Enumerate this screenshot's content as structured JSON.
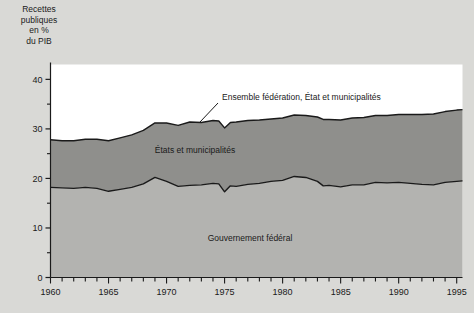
{
  "chart_data": {
    "type": "area",
    "title": "",
    "ylabel": "Recettes publiques en % du PIB",
    "xlabel": "",
    "stacked": true,
    "grid": false,
    "legend_position": "inline-annotations",
    "xlim": [
      1960,
      1995.5
    ],
    "ylim": [
      0,
      43
    ],
    "xticks_major": [
      1960,
      1965,
      1970,
      1975,
      1980,
      1985,
      1990,
      1995
    ],
    "xtick_labels": [
      "1960",
      "1965",
      "1970",
      "1975",
      "1980",
      "1985",
      "1990",
      "1995"
    ],
    "xticks_minor_step": 1,
    "yticks_major": [
      0,
      10,
      20,
      30,
      40
    ],
    "ytick_labels": [
      "0",
      "10",
      "20",
      "30",
      "40"
    ],
    "yticks_minor": [
      5,
      15,
      25,
      35
    ],
    "colors": {
      "background": "#d9d9d6",
      "plot_background": "#ffffff",
      "federal_band": "#b3b3b0",
      "state_band": "#8f8f8c",
      "line": "#1a1a1a",
      "frame": "#1a1a1a"
    },
    "x": [
      1960,
      1961,
      1962,
      1963,
      1964,
      1965,
      1966,
      1967,
      1968,
      1969,
      1970,
      1971,
      1972,
      1973,
      1974,
      1974.5,
      1975,
      1975.5,
      1976,
      1977,
      1978,
      1979,
      1980,
      1981,
      1982,
      1983,
      1983.5,
      1984,
      1985,
      1986,
      1987,
      1988,
      1989,
      1990,
      1991,
      1992,
      1993,
      1994,
      1995,
      1995.5
    ],
    "series": [
      {
        "name": "Gouvernement fédéral",
        "label": "Gouvernement fédéral",
        "values": [
          18.2,
          18.1,
          18.0,
          18.2,
          18.0,
          17.4,
          17.8,
          18.2,
          18.9,
          20.2,
          19.4,
          18.4,
          18.6,
          18.7,
          19.0,
          18.9,
          17.3,
          18.5,
          18.4,
          18.8,
          19.0,
          19.4,
          19.6,
          20.4,
          20.2,
          19.4,
          18.5,
          18.6,
          18.3,
          18.7,
          18.7,
          19.2,
          19.1,
          19.2,
          19.0,
          18.8,
          18.7,
          19.2,
          19.4,
          19.5
        ]
      },
      {
        "name": "États et municipalités",
        "label": "États et municipalités",
        "values": [
          9.6,
          9.5,
          9.6,
          9.7,
          9.9,
          10.2,
          10.4,
          10.6,
          10.8,
          11.0,
          11.8,
          12.3,
          12.8,
          12.6,
          12.7,
          12.7,
          12.9,
          12.8,
          13.0,
          12.9,
          12.8,
          12.6,
          12.6,
          12.4,
          12.5,
          13.0,
          13.4,
          13.3,
          13.5,
          13.5,
          13.6,
          13.5,
          13.6,
          13.7,
          13.9,
          14.1,
          14.3,
          14.3,
          14.4,
          14.4
        ]
      }
    ],
    "total_series": {
      "name": "Ensemble fédération, État et municipalités",
      "label": "Ensemble fédération, État et municipalités",
      "values": [
        27.8,
        27.6,
        27.6,
        27.9,
        27.9,
        27.6,
        28.2,
        28.8,
        29.7,
        31.2,
        31.2,
        30.7,
        31.4,
        31.3,
        31.7,
        31.6,
        30.2,
        31.3,
        31.4,
        31.7,
        31.8,
        32.0,
        32.2,
        32.8,
        32.7,
        32.4,
        31.9,
        31.9,
        31.8,
        32.2,
        32.3,
        32.7,
        32.7,
        32.9,
        32.9,
        32.9,
        33.0,
        33.5,
        33.8,
        33.9
      ]
    },
    "annotations": [
      {
        "text": "Ensemble fédération, État et municipalités",
        "name": "total-curve-annotation",
        "leader_line": true
      },
      {
        "text": "États et municipalités",
        "name": "state-band-annotation",
        "leader_line": false
      },
      {
        "text": "Gouvernement fédéral",
        "name": "federal-band-annotation",
        "leader_line": false
      }
    ]
  },
  "axis_title_text": "Recettes\npubliques\nen %\ndu PIB"
}
